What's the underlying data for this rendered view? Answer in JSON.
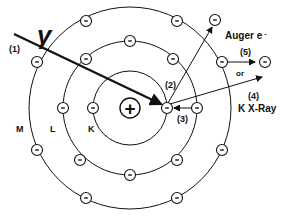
{
  "diagram": {
    "photon_symbol": "γ",
    "nucleus_symbol": "+",
    "electron_symbol": "-",
    "shells": [
      {
        "name": "K",
        "label": "K",
        "electrons": 2
      },
      {
        "name": "L",
        "label": "L",
        "electrons": 8
      },
      {
        "name": "M",
        "label": "M",
        "electrons": 8
      }
    ],
    "steps": [
      {
        "id": "1",
        "label": "(1)",
        "description": "incident photon"
      },
      {
        "id": "2",
        "label": "(2)",
        "description": "photoelectron ejected"
      },
      {
        "id": "3",
        "label": "(3)",
        "description": "L electron fills K vacancy"
      },
      {
        "id": "4",
        "label": "(4)",
        "description": "K X-Ray emitted"
      },
      {
        "id": "5",
        "label": "(5)",
        "description": "Auger electron emitted"
      }
    ],
    "auger_label": "Auger e",
    "auger_superscript": "-",
    "or_label": "or",
    "xray_label": "K X-Ray"
  }
}
